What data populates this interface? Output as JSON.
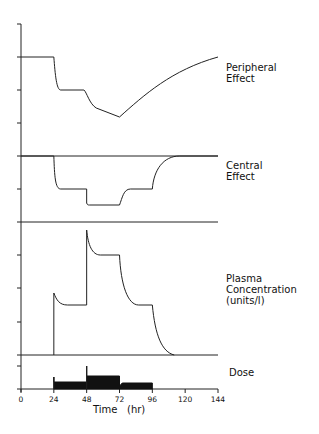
{
  "chart_data": {
    "type": "line",
    "title": "",
    "xlabel": "Time (hr)",
    "xlim": [
      0,
      144
    ],
    "x_ticks": [
      "0",
      "24",
      "48",
      "72",
      "96",
      "120",
      "144"
    ],
    "grid": false,
    "panels": [
      {
        "name": "Peripheral Effect",
        "label_lines": [
          "Peripheral",
          "Effect"
        ],
        "points": [
          [
            0,
            1.0
          ],
          [
            24,
            1.0
          ],
          [
            27,
            0.6
          ],
          [
            30,
            0.5
          ],
          [
            48,
            0.5
          ],
          [
            54,
            0.25
          ],
          [
            72,
            0.15
          ],
          [
            96,
            0.75
          ],
          [
            120,
            1.3
          ],
          [
            144,
            1.45
          ]
        ],
        "note": "relative units, 4 y ticks"
      },
      {
        "name": "Central Effect",
        "label_lines": [
          "Central",
          "Effect"
        ],
        "points": [
          [
            0,
            2
          ],
          [
            24,
            2
          ],
          [
            26,
            1.1
          ],
          [
            28,
            1
          ],
          [
            48,
            1
          ],
          [
            49,
            0.55
          ],
          [
            72,
            0.5
          ],
          [
            76,
            0.9
          ],
          [
            78,
            1
          ],
          [
            96,
            1
          ],
          [
            100,
            1.7
          ],
          [
            108,
            2
          ],
          [
            144,
            2
          ]
        ],
        "note": "relative units, 2 y ticks"
      },
      {
        "name": "Plasma Concentration (units/l)",
        "label_lines": [
          "Plasma",
          "Concentration",
          "(units/l)"
        ],
        "points": [
          [
            0,
            0
          ],
          [
            24,
            0
          ],
          [
            24,
            1.8
          ],
          [
            28,
            1.2
          ],
          [
            30,
            1.0
          ],
          [
            48,
            1.0
          ],
          [
            48,
            3.8
          ],
          [
            52,
            3.2
          ],
          [
            58,
            3.0
          ],
          [
            72,
            3.0
          ],
          [
            76,
            1.6
          ],
          [
            80,
            1.1
          ],
          [
            84,
            1.0
          ],
          [
            96,
            1.0
          ],
          [
            100,
            0.4
          ],
          [
            104,
            0.08
          ],
          [
            110,
            0
          ],
          [
            144,
            0
          ]
        ],
        "note": "4 y ticks"
      },
      {
        "name": "Dose",
        "label_lines": [
          "Dose"
        ],
        "points": [
          [
            0,
            0
          ],
          [
            24,
            0
          ],
          [
            24,
            1
          ],
          [
            48,
            1
          ],
          [
            48,
            3
          ],
          [
            48,
            1.8
          ],
          [
            72,
            1.8
          ],
          [
            72,
            0.6
          ],
          [
            76,
            1
          ],
          [
            96,
            1
          ],
          [
            96,
            0
          ],
          [
            144,
            0
          ]
        ],
        "note": "filled step profile: low dose 24-48 h, high dose 48-72 h with bolus spike at 48 h, low dose 72-96 h"
      }
    ]
  },
  "labels": {
    "peripheral": [
      "Peripheral",
      "Effect"
    ],
    "central": [
      "Central",
      "Effect"
    ],
    "plasma": [
      "Plasma",
      "Concentration",
      "(units/l)"
    ],
    "dose": "Dose",
    "xaxis": "Time   (hr)"
  }
}
